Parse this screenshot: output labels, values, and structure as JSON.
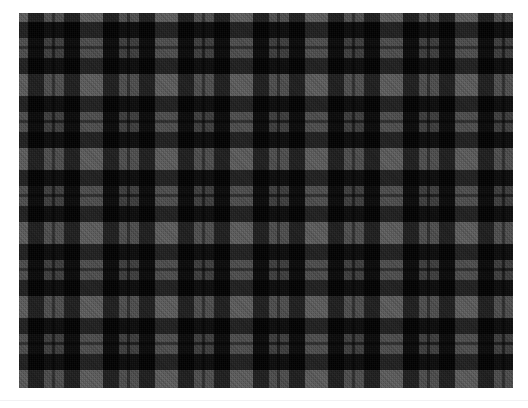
{
  "page": {
    "background_color": "#ffffff",
    "width": 528,
    "height": 408
  },
  "swatch": {
    "name": "tartan-plaid-swatch",
    "description": "Dark grey and black tartan plaid fabric swatch with 45-degree twill weave",
    "x": 19,
    "y": 13,
    "width": 494,
    "height": 375,
    "weave": "twill",
    "twill_angle_degrees": 45,
    "sett_repeat_x": 75,
    "sett_repeat_y": 74,
    "palette": {
      "black": "#0a0a0a",
      "dark_charcoal": "#1e1e1e",
      "charcoal": "#2e2e2e",
      "mid_grey": "#3f3f3f",
      "light_grey": "#525252"
    },
    "warp_stripes": [
      {
        "color": "light_grey",
        "width": 9,
        "label": "light grey"
      },
      {
        "color": "black",
        "width": 16,
        "label": "black band"
      },
      {
        "color": "mid_grey",
        "width": 8,
        "label": "mid grey"
      },
      {
        "color": "dark_charcoal",
        "width": 3,
        "label": "narrow dark line"
      },
      {
        "color": "mid_grey",
        "width": 9,
        "label": "mid grey"
      },
      {
        "color": "black",
        "width": 16,
        "label": "black band"
      },
      {
        "color": "charcoal",
        "width": 14,
        "label": "charcoal"
      }
    ],
    "weft_stripes": [
      {
        "color": "light_grey",
        "width": 9,
        "label": "light grey"
      },
      {
        "color": "black",
        "width": 16,
        "label": "black band"
      },
      {
        "color": "mid_grey",
        "width": 8,
        "label": "mid grey"
      },
      {
        "color": "dark_charcoal",
        "width": 3,
        "label": "narrow dark line"
      },
      {
        "color": "mid_grey",
        "width": 9,
        "label": "mid grey"
      },
      {
        "color": "black",
        "width": 16,
        "label": "black band"
      },
      {
        "color": "charcoal",
        "width": 13,
        "label": "charcoal"
      }
    ]
  },
  "divider": {
    "color": "#f1f1f3",
    "y": 400
  }
}
